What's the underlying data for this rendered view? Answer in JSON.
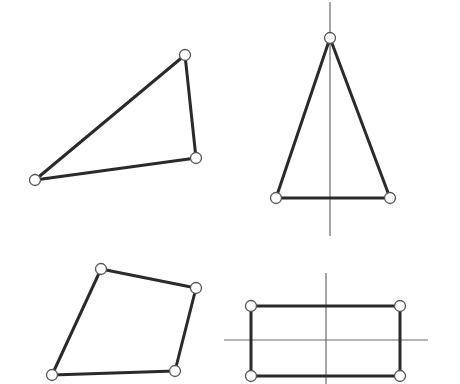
{
  "canvas": {
    "width": 460,
    "height": 384,
    "background": "#ffffff"
  },
  "colors": {
    "edge": "#2a2a2a",
    "axis": "#6a6a6a",
    "vertex_fill": "#ffffff",
    "vertex_stroke": "#555555"
  },
  "vertex_radius": 5.5,
  "shapes": [
    {
      "name": "scalene-triangle",
      "type": "polygon",
      "vertices": [
        [
          35,
          180
        ],
        [
          185,
          55
        ],
        [
          196,
          158
        ]
      ],
      "axes": []
    },
    {
      "name": "isosceles-triangle",
      "type": "polygon",
      "vertices": [
        [
          330,
          38
        ],
        [
          390,
          198
        ],
        [
          276,
          198
        ]
      ],
      "axes": [
        {
          "name": "symmetry-axis-vertical",
          "from": [
            330,
            2
          ],
          "to": [
            330,
            236
          ]
        }
      ]
    },
    {
      "name": "irregular-quadrilateral",
      "type": "polygon",
      "vertices": [
        [
          101,
          269
        ],
        [
          196,
          288
        ],
        [
          175,
          371
        ],
        [
          52,
          375
        ]
      ],
      "axes": []
    },
    {
      "name": "rectangle",
      "type": "polygon",
      "vertices": [
        [
          251,
          306
        ],
        [
          400,
          306
        ],
        [
          400,
          376
        ],
        [
          251,
          376
        ]
      ],
      "axes": [
        {
          "name": "symmetry-axis-vertical",
          "from": [
            326,
            273
          ],
          "to": [
            326,
            384
          ]
        },
        {
          "name": "symmetry-axis-horizontal",
          "from": [
            224,
            340
          ],
          "to": [
            428,
            340
          ]
        }
      ]
    }
  ]
}
